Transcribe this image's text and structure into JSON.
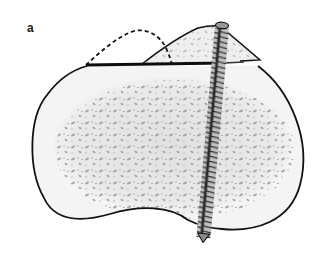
{
  "figure": {
    "panel_label": "a",
    "elements": [
      {
        "name": "bone-cross-section",
        "shape": "kidney-shaped outline with cancellous (speckled) interior"
      },
      {
        "name": "osteotomy-line",
        "shape": "thick horizontal black line across top of bone"
      },
      {
        "name": "original-fragment-outline",
        "shape": "dashed arc (original position of fragment)"
      },
      {
        "name": "displaced-fragment",
        "shape": "triangular bone fragment shifted right"
      },
      {
        "name": "fixation-screw",
        "shape": "threaded screw passing vertically through fragment and bone"
      }
    ],
    "colors": {
      "outline": "#111111",
      "bone_fill": "#f1f1f1",
      "speckle": "#9a9a9a",
      "screw_dark": "#2b2b2b",
      "screw_light": "#bdbdbd"
    }
  }
}
